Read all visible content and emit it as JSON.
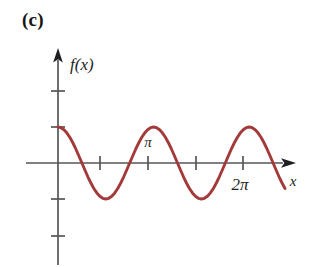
{
  "figure": {
    "panel_label": "(c)",
    "background_color": "#ffffff",
    "axis_color": "#54565a",
    "label_color": "#1d1f22"
  },
  "chart_data": {
    "type": "line",
    "title": "(c)",
    "xlabel": "x",
    "ylabel": "f(x)",
    "curve_color": "#a33a3a",
    "function": "cos",
    "amplitude": 1,
    "period": "pi/2",
    "xlim": [
      0,
      7.6
    ],
    "ylim": [
      -2.2,
      2.2
    ],
    "grid": false,
    "legend": false,
    "x_tick_labels": [
      "",
      "π",
      "",
      "2π"
    ],
    "x_tick_values": [
      1.5707963,
      3.1415927,
      4.712389,
      6.2831853
    ],
    "y_tick_values": [
      2,
      1,
      -1,
      -2
    ],
    "y_tick_labels": [
      "",
      "",
      "",
      ""
    ],
    "x": [
      0,
      0.0981748,
      0.1963495,
      0.2945243,
      0.392699,
      0.4908739,
      0.5890486,
      0.6872234,
      0.7853982,
      0.8835729,
      0.9817477,
      1.0799224,
      1.1780972,
      1.2762721,
      1.3744468,
      1.4726216,
      1.5707963,
      1.6689711,
      1.767146,
      1.8653206,
      1.9634954,
      2.0616701,
      2.1598449,
      2.2580199,
      2.3561945,
      2.4543693,
      2.552544,
      2.6507188,
      2.7488937,
      2.8470685,
      2.9452431,
      3.043418,
      3.1415927,
      3.2397675,
      3.3379424,
      3.4361172,
      3.5342917,
      3.6324666,
      3.7306414,
      3.8288162,
      3.9269909,
      4.0251656,
      4.1233406,
      4.2215152,
      4.3196901,
      4.4178648,
      4.5160398,
      4.6142144,
      4.712389,
      4.810564,
      4.9087386,
      5.0069137,
      5.1050882,
      5.2032628,
      5.3014379,
      5.3996124,
      5.4977871,
      5.5959621,
      5.6941366,
      5.7923117,
      5.8904862,
      5.9886613,
      6.0868359,
      6.1850104,
      6.2831853,
      6.38136,
      6.4795346,
      6.5777097,
      6.6758842,
      6.7740593,
      6.8722339,
      6.9704084,
      7.0685835,
      7.1667581,
      7.2649331,
      7.3631077,
      7.4612823
    ],
    "y": [
      1,
      0.98079,
      0.92388,
      0.83147,
      0.70711,
      0.55557,
      0.38268,
      0.19509,
      0,
      -0.19509,
      -0.38268,
      -0.55557,
      -0.70711,
      -0.83147,
      -0.92388,
      -0.98079,
      -1,
      -0.98079,
      -0.92388,
      -0.83147,
      -0.70711,
      -0.55557,
      -0.38268,
      -0.19509,
      0,
      0.19509,
      0.38268,
      0.55557,
      0.70711,
      0.83147,
      0.92388,
      0.98079,
      1,
      0.98079,
      0.92388,
      0.83147,
      0.70711,
      0.55557,
      0.38268,
      0.19509,
      0,
      -0.19509,
      -0.38268,
      -0.55557,
      -0.70711,
      -0.83147,
      -0.92388,
      -0.98079,
      -1,
      -0.98079,
      -0.92388,
      -0.83147,
      -0.70711,
      -0.55557,
      -0.38268,
      -0.19509,
      0,
      0.19509,
      0.38268,
      0.55557,
      0.70711,
      0.83147,
      0.92388,
      0.98079,
      1,
      0.98079,
      0.92388,
      0.83147,
      0.70711,
      0.55557,
      0.38268,
      0.19509,
      0,
      -0.19509,
      -0.38268,
      -0.55557,
      -0.70711
    ]
  },
  "labels": {
    "y_axis_label": "f(x)",
    "x_axis_label": "x",
    "pi_label": "π",
    "two_pi_label": "2π"
  }
}
